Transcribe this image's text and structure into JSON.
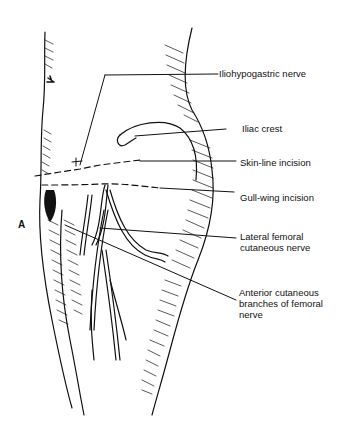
{
  "figure": {
    "panel_label": "A",
    "labels": [
      {
        "id": "iliohypogastric",
        "lines": [
          "Iliohypogastric nerve"
        ]
      },
      {
        "id": "iliac-crest",
        "lines": [
          "Iliac crest"
        ]
      },
      {
        "id": "skin-line",
        "lines": [
          "Skin-line incision"
        ]
      },
      {
        "id": "gull-wing",
        "lines": [
          "Gull-wing incision"
        ]
      },
      {
        "id": "lateral-femoral",
        "lines": [
          "Lateral femoral",
          "cutaneous nerve"
        ]
      },
      {
        "id": "anterior-cutaneous",
        "lines": [
          "Anterior cutaneous",
          "branches of femoral",
          "nerve"
        ]
      }
    ]
  }
}
